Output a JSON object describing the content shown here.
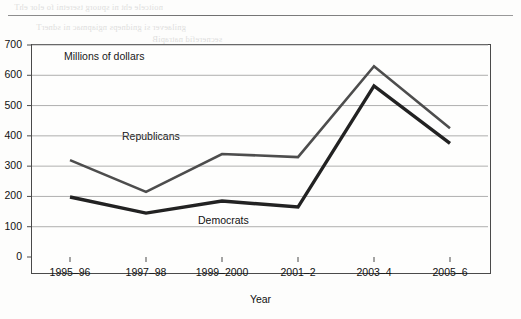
{
  "page": {
    "bleed_through_lines": [
      "noitcele eht ni spuorg tseretni fo elor ehT",
      "gnilaever si gnidneps ngiapmac ni sdnerT",
      "secnerefid natrapiB"
    ]
  },
  "chart_data": {
    "type": "line",
    "title": "",
    "subtitle": "",
    "xlabel": "Year",
    "ylabel": "Millions of dollars",
    "categories": [
      "1995–96",
      "1997–98",
      "1999–2000",
      "2001–2",
      "2003–4",
      "2005–6"
    ],
    "yticks": [
      0,
      100,
      200,
      300,
      400,
      500,
      600,
      700
    ],
    "ylim": [
      0,
      700
    ],
    "grid": "horizontal",
    "legend": "inline-labels",
    "series": [
      {
        "name": "Republicans",
        "values": [
          320,
          215,
          340,
          330,
          630,
          425
        ],
        "color": "#4d4d4d",
        "stroke_width": 2.6,
        "label_x_index": 1,
        "label_value": 395
      },
      {
        "name": "Democrats",
        "values": [
          198,
          145,
          185,
          165,
          565,
          375
        ],
        "color": "#222222",
        "stroke_width": 3.4,
        "label_x_index": 2,
        "label_value": 118
      }
    ]
  },
  "colors": {
    "republicans": "#4d4d4d",
    "democrats": "#222222",
    "gridline": "#9a9a9a",
    "axis": "#4a4a4a",
    "page_background": "#fdfdfc"
  }
}
